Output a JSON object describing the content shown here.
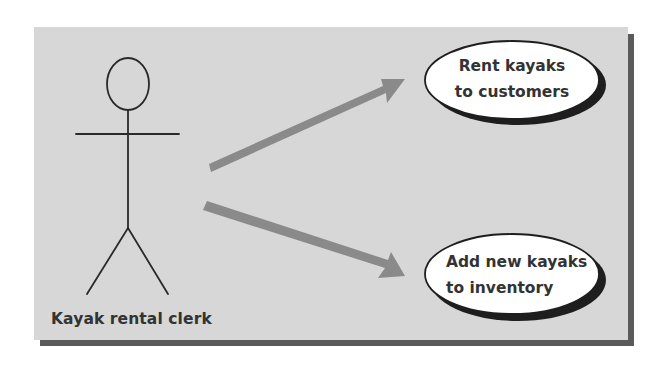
{
  "diagram": {
    "type": "use-case-diagram",
    "colors": {
      "panel_background": "#d7d7d7",
      "panel_shadow": "#5a5a5a",
      "arrow": "#8a8a8a",
      "ellipse_fill": "#ffffff",
      "ellipse_stroke": "#222222",
      "text": "#333333"
    },
    "actor": {
      "icon": "stick-figure-icon",
      "label": "Kayak rental clerk"
    },
    "use_cases": [
      {
        "id": "rent",
        "lines": [
          "Rent kayaks",
          "to customers"
        ]
      },
      {
        "id": "add",
        "lines": [
          "Add new kayaks",
          "to inventory"
        ]
      }
    ],
    "associations": [
      {
        "from": "actor",
        "to": "rent",
        "direction": "up-right"
      },
      {
        "from": "actor",
        "to": "add",
        "direction": "down-right"
      }
    ]
  }
}
